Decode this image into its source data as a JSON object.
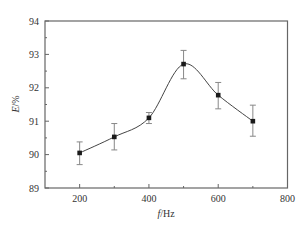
{
  "chart_data": {
    "type": "line",
    "title": "",
    "xlabel_italic": "f",
    "xlabel_rest": "/Hz",
    "ylabel_italic": "E",
    "ylabel_rest": "/%",
    "xlim": [
      100,
      800
    ],
    "ylim": [
      89,
      94
    ],
    "x_ticks": [
      200,
      400,
      600,
      800
    ],
    "x_minor_ticks": [
      300,
      500,
      700
    ],
    "y_ticks": [
      89,
      90,
      91,
      92,
      93,
      94
    ],
    "y_minor_ticks": [
      89.5,
      90.5,
      91.5,
      92.5,
      93.5
    ],
    "grid": false,
    "legend": null,
    "smooth": true,
    "series": [
      {
        "name": "E",
        "x": [
          200,
          300,
          400,
          500,
          600,
          700
        ],
        "y": [
          90.05,
          90.53,
          91.1,
          92.71,
          91.78,
          91.0
        ],
        "err_low": [
          0.35,
          0.39,
          0.17,
          0.44,
          0.41,
          0.45
        ],
        "err_high": [
          0.33,
          0.4,
          0.16,
          0.41,
          0.38,
          0.48
        ]
      }
    ],
    "colors": {
      "line": "#444444",
      "marker": "#1a1a1a",
      "errorbar": "#888888",
      "axis": "#666666"
    }
  }
}
